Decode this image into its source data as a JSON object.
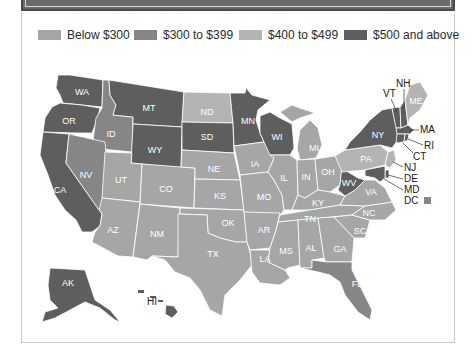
{
  "legend": {
    "items": [
      {
        "label": "Below $300",
        "color": "#a6a6a6"
      },
      {
        "label": "$300 to $399",
        "color": "#868686"
      },
      {
        "label": "$400 to $499",
        "color": "#b4b4b4"
      },
      {
        "label": "$500 and above",
        "color": "#5e5e5e"
      }
    ]
  },
  "map": {
    "states": {
      "WA": "$500 and above",
      "OR": "$500 and above",
      "CA": "$500 and above",
      "ID": "$300 to $399",
      "NV": "$300 to $399",
      "MT": "$500 and above",
      "WY": "$500 and above",
      "UT": "Below $300",
      "CO": "Below $300",
      "AZ": "Below $300",
      "NM": "Below $300",
      "ND": "$400 to $499",
      "SD": "$500 and above",
      "NE": "Below $300",
      "KS": "Below $300",
      "OK": "Below $300",
      "TX": "Below $300",
      "MN": "$500 and above",
      "IA": "Below $300",
      "MO": "Below $300",
      "AR": "Below $300",
      "LA": "Below $300",
      "WI": "$500 and above",
      "IL": "Below $300",
      "MI": "Below $300",
      "IN": "Below $300",
      "OH": "Below $300",
      "KY": "Below $300",
      "TN": "Below $300",
      "MS": "Below $300",
      "AL": "Below $300",
      "GA": "Below $300",
      "FL": "$300 to $399",
      "SC": "Below $300",
      "NC": "Below $300",
      "VA": "Below $300",
      "WV": "$500 and above",
      "PA": "$400 to $499",
      "NY": "$500 and above",
      "VT": "$500 and above",
      "NH": "$500 and above",
      "ME": "$400 to $499",
      "MA": "$500 and above",
      "RI": "$500 and above",
      "CT": "$500 and above",
      "NJ": "$400 to $499",
      "DE": "$500 and above",
      "MD": "$500 and above",
      "DC": "$300 to $399",
      "AK": "$500 and above",
      "HI": "$500 and above"
    },
    "labels": {
      "WA": "WA",
      "OR": "OR",
      "CA": "CA",
      "ID": "ID",
      "NV": "NV",
      "MT": "MT",
      "WY": "WY",
      "UT": "UT",
      "CO": "CO",
      "AZ": "AZ",
      "NM": "NM",
      "ND": "ND",
      "SD": "SD",
      "NE": "NE",
      "KS": "KS",
      "OK": "OK",
      "TX": "TX",
      "MN": "MN",
      "IA": "IA",
      "MO": "MO",
      "AR": "AR",
      "LA": "LA",
      "WI": "WI",
      "IL": "IL",
      "MI": "MI",
      "IN": "IN",
      "OH": "OH",
      "KY": "KY",
      "TN": "TN",
      "MS": "MS",
      "AL": "AL",
      "GA": "GA",
      "FL": "FL",
      "SC": "SC",
      "NC": "NC",
      "VA": "VA",
      "WV": "WV",
      "PA": "PA",
      "NY": "NY",
      "ME": "ME",
      "AK": "AK",
      "VT": "VT",
      "NH": "NH",
      "MA": "MA",
      "RI": "RI",
      "CT": "CT",
      "NJ": "NJ",
      "DE": "DE",
      "MD": "MD",
      "DC": "DC",
      "HI": "HI"
    }
  }
}
